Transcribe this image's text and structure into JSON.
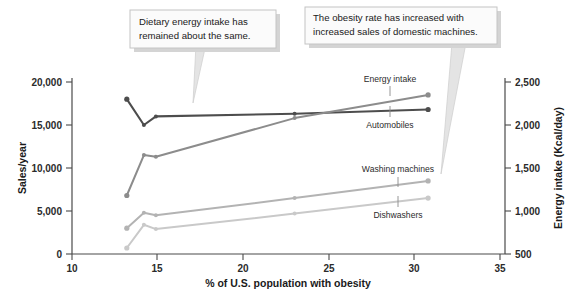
{
  "chart_data": {
    "type": "line",
    "title": "",
    "xlabel": "% of U.S. population with obesity",
    "ylabel": "Sales/year",
    "y2label": "Energy intake (Kcal/day)",
    "xlim": [
      10,
      35
    ],
    "ylim": [
      0,
      20000
    ],
    "y2lim": [
      500,
      2500
    ],
    "xticks": [
      "10",
      "15",
      "20",
      "25",
      "30",
      "35"
    ],
    "xtick_values": [
      10,
      15,
      20,
      25,
      30,
      35
    ],
    "yticks": [
      "0",
      "5,000",
      "10,000",
      "15,000",
      "20,000"
    ],
    "ytick_values": [
      0,
      5000,
      10000,
      15000,
      20000
    ],
    "y2ticks": [
      "500",
      "1,000",
      "1,500",
      "2,000",
      "2,500"
    ],
    "y2tick_values": [
      500,
      1000,
      1500,
      2000,
      2500
    ],
    "grid": false,
    "legend": "inline-labels",
    "series": [
      {
        "name": "Energy intake",
        "axis": "right",
        "color": "#4d4d4d",
        "x": [
          13.2,
          14.2,
          14.9,
          23.0,
          30.8
        ],
        "values": [
          2300,
          2000,
          2100,
          2130,
          2180
        ]
      },
      {
        "name": "Automobiles",
        "axis": "left",
        "color": "#8c8c8c",
        "x": [
          13.2,
          14.2,
          14.9,
          23.0,
          30.8
        ],
        "values": [
          6800,
          11500,
          11300,
          15800,
          18500
        ]
      },
      {
        "name": "Washing machines",
        "axis": "left",
        "color": "#b3b3b3",
        "x": [
          13.2,
          14.2,
          14.9,
          23.0,
          30.8
        ],
        "values": [
          3000,
          4800,
          4500,
          6500,
          8500
        ]
      },
      {
        "name": "Dishwashers",
        "axis": "left",
        "color": "#c9c9c9",
        "x": [
          13.2,
          14.2,
          14.9,
          23.0,
          30.8
        ],
        "values": [
          700,
          3400,
          2900,
          4700,
          6500
        ]
      }
    ],
    "annotations": [
      {
        "id": "callout-energy-intake",
        "lines": [
          "Dietary energy intake has",
          "remained about the same."
        ],
        "points_to": "Energy intake"
      },
      {
        "id": "callout-obesity-rate",
        "lines": [
          "The obesity rate has increased with",
          "increased sales of domestic machines."
        ],
        "points_to": "domestic machines series"
      }
    ]
  },
  "colors": {
    "axis": "#4a4a4a",
    "text": "#1a1a1a",
    "callout_fill": "#fbfbfb",
    "callout_border": "#c4c4c4",
    "callout_shadow": "#cfcfcf"
  }
}
